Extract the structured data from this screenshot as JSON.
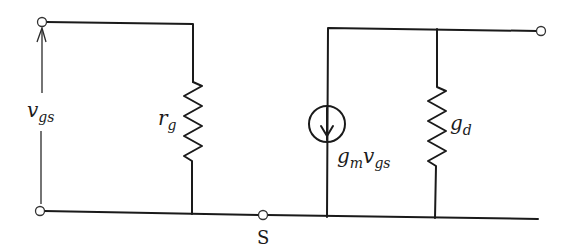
{
  "diagram": {
    "type": "small-signal equivalent circuit",
    "labels": {
      "vgs_base": "v",
      "vgs_sub": "gs",
      "rg_base": "r",
      "rg_sub": "g",
      "gd_base": "g",
      "gd_sub": "d",
      "source_gm_base": "g",
      "source_gm_sub": "m",
      "source_v_base": "v",
      "source_v_sub": "gs",
      "source_node": "S"
    },
    "components": [
      {
        "id": "rg",
        "kind": "resistor",
        "label": "r_g"
      },
      {
        "id": "current-source",
        "kind": "dependent current source",
        "label": "g_m v_gs",
        "direction": "down"
      },
      {
        "id": "gd",
        "kind": "resistor",
        "label": "g_d"
      }
    ],
    "terminals": [
      "gate-input-top",
      "gate-input-bottom",
      "source-S",
      "drain-output"
    ],
    "colors": {
      "ink": "#1a1a1a",
      "background": "#ffffff"
    }
  }
}
